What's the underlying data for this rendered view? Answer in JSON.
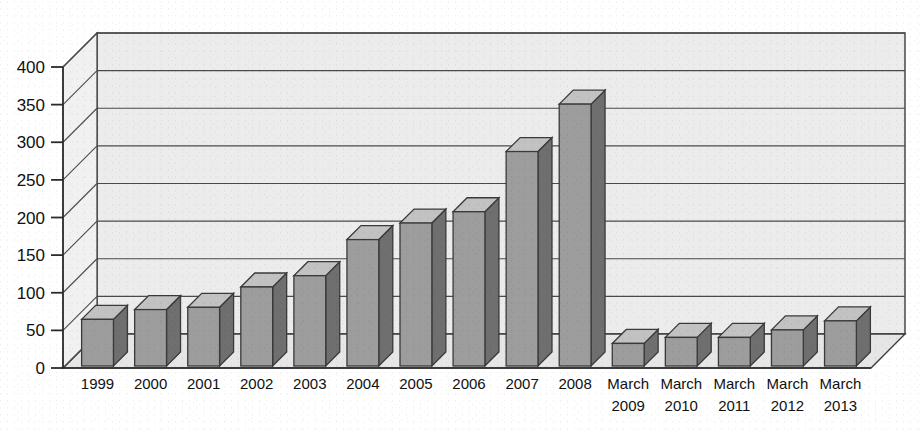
{
  "chart_data": {
    "type": "bar",
    "title": "",
    "subtitle": "",
    "xlabel": "",
    "ylabel": "",
    "style": "3d-column",
    "grid": true,
    "legend": null,
    "ylim": [
      0,
      400
    ],
    "yticks": [
      0,
      50,
      100,
      150,
      200,
      250,
      300,
      350,
      400
    ],
    "ytick_labels": [
      "0",
      "50",
      "100",
      "150",
      "200",
      "250",
      "300",
      "350",
      "400"
    ],
    "categories": [
      "1999",
      "2000",
      "2001",
      "2002",
      "2003",
      "2004",
      "2005",
      "2006",
      "2007",
      "2008",
      "March\n2009",
      "March\n2010",
      "March\n2011",
      "March\n2012",
      "March\n2013"
    ],
    "category_lines": [
      [
        "1999"
      ],
      [
        "2000"
      ],
      [
        "2001"
      ],
      [
        "2002"
      ],
      [
        "2003"
      ],
      [
        "2004"
      ],
      [
        "2005"
      ],
      [
        "2006"
      ],
      [
        "2007"
      ],
      [
        "2008"
      ],
      [
        "March",
        "2009"
      ],
      [
        "March",
        "2010"
      ],
      [
        "March",
        "2011"
      ],
      [
        "March",
        "2012"
      ],
      [
        "March",
        "2013"
      ]
    ],
    "values": [
      62,
      75,
      78,
      105,
      120,
      168,
      190,
      205,
      285,
      348,
      30,
      38,
      38,
      48,
      60
    ],
    "colors": {
      "bar_front": "#9d9d9d",
      "bar_top": "#c2c2c2",
      "bar_side": "#6f6f6f",
      "bar_outline": "#3a3a3a",
      "plot_background": "#ececec",
      "floor": "#e4e4e4",
      "gridline": "#4a4a4a",
      "axis": "#2b2b2b",
      "text": "#111111",
      "page_background": "#ffffff"
    }
  },
  "axes": {
    "y_axis_name": "value-axis",
    "x_axis_name": "category-axis"
  }
}
